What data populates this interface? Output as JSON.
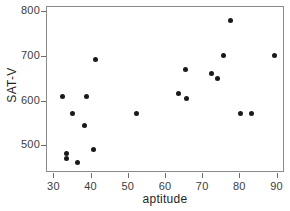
{
  "chart_data": {
    "type": "scatter",
    "title": "",
    "xlabel": "aptitude",
    "ylabel": "SAT-V",
    "xlim": [
      28,
      92
    ],
    "ylim": [
      440,
      812
    ],
    "grid": false,
    "legend": null,
    "xticks": [
      30,
      40,
      50,
      60,
      70,
      80,
      90
    ],
    "yticks": [
      500,
      600,
      700,
      800
    ],
    "marker": {
      "shape": "circle",
      "filled": true,
      "color": "#1a1a1a",
      "size_px": 5
    },
    "points": [
      {
        "x": 32.5,
        "y": 610
      },
      {
        "x": 39.0,
        "y": 610
      },
      {
        "x": 35.0,
        "y": 572
      },
      {
        "x": 38.3,
        "y": 545
      },
      {
        "x": 33.5,
        "y": 482
      },
      {
        "x": 33.5,
        "y": 470
      },
      {
        "x": 40.8,
        "y": 490
      },
      {
        "x": 36.5,
        "y": 462
      },
      {
        "x": 41.3,
        "y": 692
      },
      {
        "x": 52.3,
        "y": 570
      },
      {
        "x": 65.5,
        "y": 670
      },
      {
        "x": 72.5,
        "y": 660
      },
      {
        "x": 63.7,
        "y": 615
      },
      {
        "x": 65.8,
        "y": 605
      },
      {
        "x": 75.8,
        "y": 700
      },
      {
        "x": 89.5,
        "y": 700
      },
      {
        "x": 77.5,
        "y": 780
      },
      {
        "x": 80.3,
        "y": 570
      },
      {
        "x": 83.3,
        "y": 570
      },
      {
        "x": 74.0,
        "y": 650
      }
    ]
  }
}
